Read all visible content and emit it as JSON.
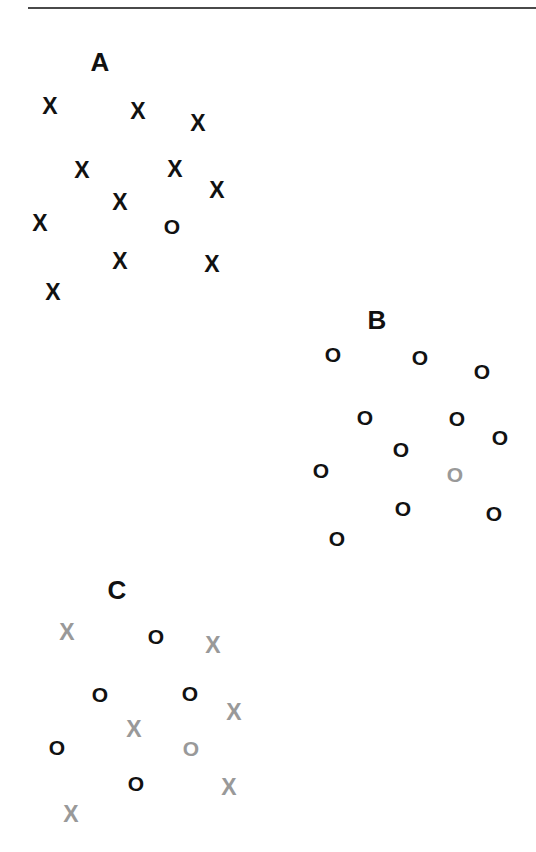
{
  "figure": {
    "width": 536,
    "height": 852,
    "background": "#ffffff",
    "divider": {
      "x": 28,
      "y": 7,
      "width": 508,
      "height": 2,
      "color": "#4a4a4a"
    },
    "colors": {
      "dark": "#111111",
      "gray": "#999999",
      "rule": "#4a4a4a"
    }
  },
  "chart_data": {
    "type": "scatter",
    "title": "",
    "xlabel": "",
    "ylabel": "",
    "xlim": [
      0,
      536
    ],
    "ylim": [
      0,
      852
    ],
    "grid": false,
    "legend": "none",
    "marker_glyphs": {
      "x": "X",
      "o": "O"
    },
    "annotations": [
      {
        "text": "A",
        "x": 100,
        "y": 62,
        "font_size": 26,
        "color": "#111111"
      },
      {
        "text": "B",
        "x": 377,
        "y": 320,
        "font_size": 26,
        "color": "#111111"
      },
      {
        "text": "C",
        "x": 117,
        "y": 590,
        "font_size": 26,
        "color": "#111111"
      }
    ],
    "clusters": [
      {
        "name": "A",
        "label": "A",
        "label_x": 100,
        "label_y": 62,
        "dominant_marker": "X",
        "point_count": 12,
        "points": [
          {
            "glyph": "X",
            "x": 50,
            "y": 106,
            "color": "#111111"
          },
          {
            "glyph": "X",
            "x": 138,
            "y": 111,
            "color": "#111111"
          },
          {
            "glyph": "X",
            "x": 198,
            "y": 123,
            "color": "#111111"
          },
          {
            "glyph": "X",
            "x": 82,
            "y": 170,
            "color": "#111111"
          },
          {
            "glyph": "X",
            "x": 175,
            "y": 169,
            "color": "#111111"
          },
          {
            "glyph": "X",
            "x": 217,
            "y": 190,
            "color": "#111111"
          },
          {
            "glyph": "X",
            "x": 120,
            "y": 202,
            "color": "#111111"
          },
          {
            "glyph": "X",
            "x": 40,
            "y": 223,
            "color": "#111111"
          },
          {
            "glyph": "O",
            "x": 172,
            "y": 226,
            "color": "#111111"
          },
          {
            "glyph": "X",
            "x": 120,
            "y": 261,
            "color": "#111111"
          },
          {
            "glyph": "X",
            "x": 212,
            "y": 264,
            "color": "#111111"
          },
          {
            "glyph": "X",
            "x": 53,
            "y": 292,
            "color": "#111111"
          }
        ]
      },
      {
        "name": "B",
        "label": "B",
        "label_x": 377,
        "label_y": 320,
        "dominant_marker": "O",
        "point_count": 11,
        "points": [
          {
            "glyph": "O",
            "x": 333,
            "y": 354,
            "color": "#111111"
          },
          {
            "glyph": "O",
            "x": 420,
            "y": 357,
            "color": "#111111"
          },
          {
            "glyph": "O",
            "x": 482,
            "y": 371,
            "color": "#111111"
          },
          {
            "glyph": "O",
            "x": 365,
            "y": 417,
            "color": "#111111"
          },
          {
            "glyph": "O",
            "x": 457,
            "y": 418,
            "color": "#111111"
          },
          {
            "glyph": "O",
            "x": 500,
            "y": 437,
            "color": "#111111"
          },
          {
            "glyph": "O",
            "x": 401,
            "y": 449,
            "color": "#111111"
          },
          {
            "glyph": "O",
            "x": 321,
            "y": 470,
            "color": "#111111"
          },
          {
            "glyph": "O",
            "x": 455,
            "y": 474,
            "color": "#999999"
          },
          {
            "glyph": "O",
            "x": 403,
            "y": 508,
            "color": "#111111"
          },
          {
            "glyph": "O",
            "x": 494,
            "y": 513,
            "color": "#111111"
          },
          {
            "glyph": "O",
            "x": 337,
            "y": 538,
            "color": "#111111"
          }
        ]
      },
      {
        "name": "C",
        "label": "C",
        "label_x": 117,
        "label_y": 590,
        "dominant_marker": "mixed",
        "point_count": 12,
        "points": [
          {
            "glyph": "X",
            "x": 67,
            "y": 632,
            "color": "#999999"
          },
          {
            "glyph": "O",
            "x": 156,
            "y": 636,
            "color": "#111111"
          },
          {
            "glyph": "X",
            "x": 213,
            "y": 645,
            "color": "#999999"
          },
          {
            "glyph": "O",
            "x": 100,
            "y": 694,
            "color": "#111111"
          },
          {
            "glyph": "O",
            "x": 190,
            "y": 693,
            "color": "#111111"
          },
          {
            "glyph": "X",
            "x": 234,
            "y": 712,
            "color": "#999999"
          },
          {
            "glyph": "X",
            "x": 134,
            "y": 729,
            "color": "#999999"
          },
          {
            "glyph": "O",
            "x": 57,
            "y": 747,
            "color": "#111111"
          },
          {
            "glyph": "O",
            "x": 191,
            "y": 748,
            "color": "#999999"
          },
          {
            "glyph": "O",
            "x": 136,
            "y": 783,
            "color": "#111111"
          },
          {
            "glyph": "X",
            "x": 229,
            "y": 787,
            "color": "#999999"
          },
          {
            "glyph": "X",
            "x": 71,
            "y": 814,
            "color": "#999999"
          }
        ]
      }
    ]
  }
}
